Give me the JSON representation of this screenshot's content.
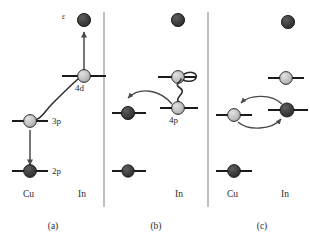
{
  "figure": {
    "background": "#ffffff",
    "colors": {
      "level_line": "#1a1a1a",
      "circle_light": "#bfbfbf",
      "circle_dark": "#3c3c3c",
      "circle_stroke": "#1a1a1a",
      "arrow": "#4a4a4a",
      "divider": "#8c8c8c",
      "text": "#2b2b2b"
    },
    "dividers": [
      {
        "name": "divider-a-b",
        "x": 104
      },
      {
        "name": "divider-b-c",
        "x": 208
      }
    ]
  },
  "panels": [
    {
      "id": "a",
      "caption": "(a)",
      "axis_labels": {
        "left": "Cu",
        "right": "In"
      },
      "free_electron_label": "ε",
      "levels": [
        {
          "name": "cu-3p",
          "label": "3p",
          "element": "Cu",
          "fill": "light",
          "occupied": true
        },
        {
          "name": "cu-2p",
          "label": "2p",
          "element": "Cu",
          "fill": "dark",
          "occupied": true
        },
        {
          "name": "in-4d",
          "label": "4d",
          "element": "In",
          "fill": "light",
          "occupied": true
        }
      ],
      "free_particle": {
        "name": "ejected-electron",
        "fill": "dark"
      },
      "transitions": [
        {
          "name": "arrow-3p-to-2p",
          "type": "straight-arrow",
          "direction": "down",
          "from": "cu-3p",
          "to": "cu-2p"
        },
        {
          "name": "squiggle-3p-to-4d",
          "type": "wavy-coupling",
          "from": "cu-3p",
          "to": "in-4d"
        },
        {
          "name": "arrow-4d-to-vacuum",
          "type": "straight-arrow",
          "direction": "up",
          "from": "in-4d",
          "to": "ejected-electron"
        }
      ]
    },
    {
      "id": "b",
      "caption": "(b)",
      "axis_labels": {
        "left": "",
        "right": "In"
      },
      "levels": [
        {
          "name": "cu-mid-b",
          "label": "",
          "element": "Cu",
          "fill": "dark",
          "occupied": true
        },
        {
          "name": "cu-low-b",
          "label": "",
          "element": "Cu",
          "fill": "dark",
          "occupied": true
        },
        {
          "name": "in-upper-b",
          "label": "",
          "element": "In",
          "fill": "light",
          "occupied": true
        },
        {
          "name": "in-4p",
          "label": "4p",
          "element": "In",
          "fill": "light",
          "occupied": true
        }
      ],
      "free_particle": {
        "name": "free-electron-b",
        "fill": "dark"
      },
      "transitions": [
        {
          "name": "squiggle-4p-to-upper",
          "type": "wavy-coupling",
          "from": "in-4p",
          "to": "in-upper-b"
        },
        {
          "name": "hook-loop-upper",
          "type": "loop",
          "at": "in-upper-b"
        },
        {
          "name": "arrow-in-to-cu",
          "type": "curved-arrow",
          "direction": "left",
          "from": "in-4p",
          "to": "cu-mid-b"
        }
      ]
    },
    {
      "id": "c",
      "caption": "(c)",
      "axis_labels": {
        "left": "Cu",
        "right": "In"
      },
      "levels": [
        {
          "name": "cu-mid-c",
          "label": "",
          "element": "Cu",
          "fill": "light",
          "occupied": true
        },
        {
          "name": "cu-low-c",
          "label": "",
          "element": "Cu",
          "fill": "dark",
          "occupied": true
        },
        {
          "name": "in-upper-c",
          "label": "",
          "element": "In",
          "fill": "light",
          "occupied": true
        },
        {
          "name": "in-mid-c",
          "label": "",
          "element": "In",
          "fill": "dark",
          "occupied": true
        }
      ],
      "free_particle": {
        "name": "free-electron-c",
        "fill": "dark"
      },
      "transitions": [
        {
          "name": "arrow-exchange-top",
          "type": "curved-arrow",
          "direction": "left",
          "from": "in-mid-c",
          "to": "cu-mid-c"
        },
        {
          "name": "arrow-exchange-bottom",
          "type": "curved-arrow",
          "direction": "right",
          "from": "cu-mid-c",
          "to": "in-mid-c"
        }
      ]
    }
  ]
}
